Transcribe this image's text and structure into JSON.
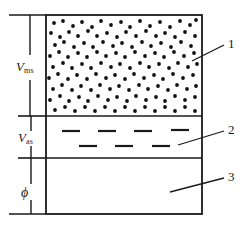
{
  "figure": {
    "kind": "three-phase-volume-diagram",
    "colors": {
      "line": "#1a1a1a",
      "fill": "#ffffff",
      "dot": "#111111",
      "dash": "#1a1a1a"
    }
  },
  "dimension_labels": [
    {
      "id": "v-ms",
      "symbol": "V",
      "subscript": "ms",
      "region": "top"
    },
    {
      "id": "v-as",
      "symbol": "V",
      "subscript": "as",
      "region": "middle"
    },
    {
      "id": "phi",
      "symbol": "ϕ",
      "subscript": "",
      "region": "bottom"
    }
  ],
  "callouts": [
    {
      "id": "callout-1",
      "label": "1",
      "target_region": "dotted-layer"
    },
    {
      "id": "callout-2",
      "label": "2",
      "target_region": "dashed-layer"
    },
    {
      "id": "callout-3",
      "label": "3",
      "target_region": "empty-layer"
    }
  ],
  "regions": [
    {
      "id": "region-dotted",
      "pattern": "dots"
    },
    {
      "id": "region-dashed",
      "pattern": "dashes"
    },
    {
      "id": "region-empty",
      "pattern": "blank"
    }
  ]
}
